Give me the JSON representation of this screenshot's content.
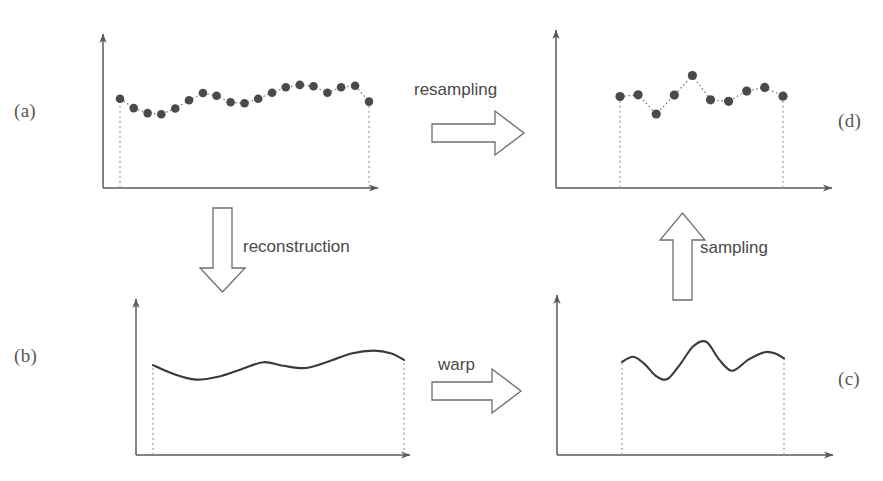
{
  "figure": {
    "background_color": "#ffffff",
    "axis_color": "#5a5a5a",
    "curve_color": "#3a3a3a",
    "dot_color": "#4a4a4a",
    "dashed_color": "#8a8a8a",
    "arrow_outline_color": "#6e6e6e",
    "text_color": "#4a4a4a"
  },
  "labels": {
    "a": "(a)",
    "b": "(b)",
    "c": "(c)",
    "d": "(d)"
  },
  "transitions": [
    {
      "name": "resampling",
      "label": "resampling",
      "direction": "right",
      "from": "a",
      "to": "d"
    },
    {
      "name": "reconstruction",
      "label": "reconstruction",
      "direction": "down",
      "from": "a",
      "to": "b"
    },
    {
      "name": "warp",
      "label": "warp",
      "direction": "right",
      "from": "b",
      "to": "c"
    },
    {
      "name": "sampling",
      "label": "sampling",
      "direction": "up",
      "from": "c",
      "to": "d"
    }
  ],
  "arrow_labels": {
    "resampling": "resampling",
    "reconstruction": "reconstruction",
    "warp": "warp",
    "sampling": "sampling"
  },
  "chart_data": [
    {
      "id": "a",
      "type": "scatter",
      "title": "",
      "xlabel": "",
      "ylabel": "",
      "grid": false,
      "legend": "none",
      "note": "Discrete samples of original signal, joined by dotted interpolation line; dashed verticals drop from first and last sample to the x-axis.",
      "marker": "filled-circle",
      "line_style": "dotted",
      "xlim": [
        0,
        1
      ],
      "ylim": [
        0,
        1
      ],
      "x": [
        0.0,
        0.055,
        0.111,
        0.166,
        0.222,
        0.277,
        0.333,
        0.388,
        0.444,
        0.5,
        0.555,
        0.611,
        0.666,
        0.722,
        0.777,
        0.833,
        0.888,
        0.944,
        1.0
      ],
      "y": [
        0.62,
        0.555,
        0.52,
        0.512,
        0.552,
        0.61,
        0.66,
        0.64,
        0.596,
        0.588,
        0.62,
        0.662,
        0.7,
        0.716,
        0.706,
        0.662,
        0.7,
        0.71,
        0.6
      ]
    },
    {
      "id": "b",
      "type": "line",
      "title": "",
      "xlabel": "",
      "ylabel": "",
      "grid": false,
      "legend": "none",
      "note": "Continuous reconstructed signal (smooth curve) over the same interval.",
      "line_style": "solid",
      "xlim": [
        0,
        1
      ],
      "ylim": [
        0,
        1
      ],
      "x": [
        0.0,
        0.08,
        0.17,
        0.26,
        0.35,
        0.44,
        0.52,
        0.61,
        0.7,
        0.79,
        0.88,
        0.95,
        1.0
      ],
      "y": [
        0.62,
        0.56,
        0.52,
        0.54,
        0.59,
        0.64,
        0.615,
        0.6,
        0.645,
        0.7,
        0.72,
        0.7,
        0.655
      ]
    },
    {
      "id": "c",
      "type": "line",
      "title": "",
      "xlabel": "",
      "ylabel": "",
      "grid": false,
      "legend": "none",
      "note": "Warped continuous signal: horizontal axis has been deformed, compressing and amplifying the central feature into a tall peak.",
      "line_style": "solid",
      "xlim": [
        0,
        1
      ],
      "ylim": [
        0,
        1
      ],
      "x": [
        0.0,
        0.07,
        0.14,
        0.21,
        0.28,
        0.36,
        0.44,
        0.52,
        0.6,
        0.68,
        0.78,
        0.88,
        0.95,
        1.0
      ],
      "y": [
        0.625,
        0.66,
        0.61,
        0.53,
        0.51,
        0.61,
        0.73,
        0.76,
        0.64,
        0.565,
        0.64,
        0.69,
        0.68,
        0.648
      ]
    },
    {
      "id": "d",
      "type": "scatter",
      "title": "",
      "xlabel": "",
      "ylabel": "",
      "grid": false,
      "legend": "none",
      "note": "Resampled discrete signal obtained by sampling the warped curve; dotted interpolation between samples.",
      "marker": "filled-circle",
      "line_style": "dotted",
      "xlim": [
        0,
        1
      ],
      "ylim": [
        0,
        1
      ],
      "x": [
        0.0,
        0.111,
        0.222,
        0.333,
        0.444,
        0.555,
        0.666,
        0.777,
        0.888,
        1.0
      ],
      "y": [
        0.618,
        0.63,
        0.5,
        0.628,
        0.76,
        0.596,
        0.586,
        0.655,
        0.68,
        0.62
      ]
    }
  ]
}
